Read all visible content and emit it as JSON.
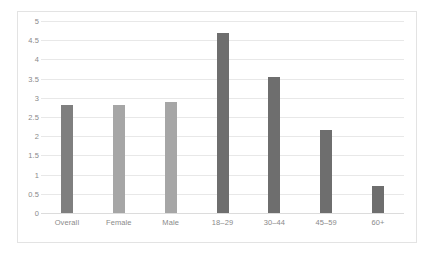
{
  "chart_data": {
    "type": "bar",
    "title": "",
    "subtitle": "",
    "xlabel": "",
    "ylabel": "",
    "categories": [
      "Overall",
      "Female",
      "Male",
      "18–29",
      "30–44",
      "45–59",
      "60+"
    ],
    "values": [
      2.8,
      2.8,
      2.9,
      4.7,
      3.55,
      2.15,
      0.7
    ],
    "bar_colors": [
      "#7f7f7f",
      "#a6a6a6",
      "#a6a6a6",
      "#6e6e6e",
      "#6e6e6e",
      "#6e6e6e",
      "#6e6e6e"
    ],
    "ylim": [
      0,
      5
    ],
    "ytick_values": [
      0,
      0.5,
      1,
      1.5,
      2,
      2.5,
      3,
      3.5,
      4,
      4.5,
      5
    ],
    "ytick_labels": [
      "0",
      "0.5",
      "1",
      "1.5",
      "2",
      "2.5",
      "3",
      "3.5",
      "4",
      "4.5",
      "5"
    ],
    "grid": true,
    "grid_orientation": "horizontal",
    "legend": false,
    "legend_position": "none",
    "plot_background": "#ffffff",
    "gridline_color": "#e8e8e8",
    "axis_text_color": "#8a8a8a",
    "border_color": "#e3e3e3"
  }
}
